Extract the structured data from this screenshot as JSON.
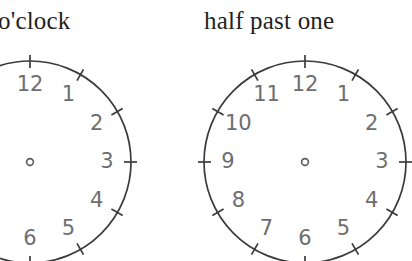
{
  "page": {
    "background_color": "#ffffff",
    "width": 412,
    "height": 261
  },
  "headings": {
    "left": "o'clock",
    "right": "half past one"
  },
  "colors": {
    "heading_text": "#231f20",
    "dial_stroke": "#3b3b3b",
    "numeral_text": "#6e6e70",
    "hub_stroke": "#5a5a5a"
  },
  "clocks": [
    {
      "id": "clock-left",
      "label": "o'clock",
      "center_x": 30,
      "center_y": 162,
      "radius": 101,
      "hub_radius": 3.4,
      "cropped": true,
      "hands": [],
      "numerals": [
        {
          "value": "12",
          "hour": 12,
          "visible": true
        },
        {
          "value": "1",
          "hour": 1,
          "visible": true
        },
        {
          "value": "2",
          "hour": 2,
          "visible": true
        },
        {
          "value": "3",
          "hour": 3,
          "visible": true
        },
        {
          "value": "4",
          "hour": 4,
          "visible": true
        },
        {
          "value": "5",
          "hour": 5,
          "visible": true
        },
        {
          "value": "6",
          "hour": 6,
          "visible": true
        },
        {
          "value": "7",
          "hour": 7,
          "visible": false
        },
        {
          "value": "8",
          "hour": 8,
          "visible": false
        },
        {
          "value": "9",
          "hour": 9,
          "visible": false
        },
        {
          "value": "10",
          "hour": 10,
          "visible": false
        },
        {
          "value": "11",
          "hour": 11,
          "visible": false
        }
      ]
    },
    {
      "id": "clock-right",
      "label": "half past one",
      "center_x": 305,
      "center_y": 162,
      "radius": 101,
      "hub_radius": 3.4,
      "cropped": false,
      "hands": [],
      "numerals": [
        {
          "value": "12",
          "hour": 12,
          "visible": true
        },
        {
          "value": "1",
          "hour": 1,
          "visible": true
        },
        {
          "value": "2",
          "hour": 2,
          "visible": true
        },
        {
          "value": "3",
          "hour": 3,
          "visible": true
        },
        {
          "value": "4",
          "hour": 4,
          "visible": true
        },
        {
          "value": "5",
          "hour": 5,
          "visible": true
        },
        {
          "value": "6",
          "hour": 6,
          "visible": true
        },
        {
          "value": "7",
          "hour": 7,
          "visible": true
        },
        {
          "value": "8",
          "hour": 8,
          "visible": true
        },
        {
          "value": "9",
          "hour": 9,
          "visible": true
        },
        {
          "value": "10",
          "hour": 10,
          "visible": true
        },
        {
          "value": "11",
          "hour": 11,
          "visible": true
        }
      ]
    }
  ]
}
